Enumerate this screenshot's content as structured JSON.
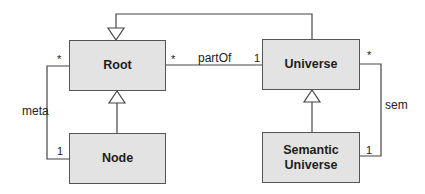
{
  "diagram": {
    "type": "UML class diagram",
    "colors": {
      "box_fill": "#e3e3e3",
      "box_border": "#555555",
      "line": "#444444",
      "text": "#1e1e1e"
    },
    "classes": [
      {
        "id": "root",
        "name": "Root"
      },
      {
        "id": "universe",
        "name": "Universe"
      },
      {
        "id": "node",
        "name": "Node"
      },
      {
        "id": "semantic_universe",
        "name_line1": "Semantic",
        "name_line2": "Universe"
      }
    ],
    "associations": [
      {
        "id": "partOf",
        "label": "partOf",
        "from": "Root",
        "to": "Universe",
        "from_mult": "*",
        "to_mult": "1"
      },
      {
        "id": "meta",
        "label": "meta",
        "from": "Root",
        "to": "Node",
        "from_mult": "*",
        "to_mult": "1"
      },
      {
        "id": "sem",
        "label": "sem",
        "from": "Universe",
        "to": "Semantic Universe",
        "from_mult": "*",
        "to_mult": "1"
      }
    ],
    "generalizations": [
      {
        "child": "Node",
        "parent": "Root"
      },
      {
        "child": "Semantic Universe",
        "parent": "Universe"
      },
      {
        "child": "Universe",
        "parent": "Root"
      }
    ]
  }
}
